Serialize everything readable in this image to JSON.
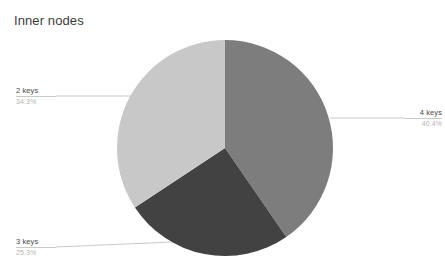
{
  "chart_data": {
    "type": "pie",
    "title": "Inner nodes",
    "categories": [
      "4 keys",
      "3 keys",
      "2 keys"
    ],
    "values": [
      40.4,
      25.3,
      34.3
    ],
    "value_labels": [
      "40.4%",
      "25.3%",
      "34.3%"
    ],
    "colors": [
      "#7d7d7d",
      "#424242",
      "#c8c8c8"
    ],
    "start_angle_deg": 0,
    "direction": "clockwise",
    "legend": "none",
    "grid": false,
    "labels_position": "outside-with-leader-lines",
    "background": "#ffffff",
    "slices": [
      {
        "name": "4 keys",
        "percent_label": "40.4%",
        "percent": 40.4,
        "color": "#7d7d7d",
        "label_side": "right"
      },
      {
        "name": "3 keys",
        "percent_label": "25.3%",
        "percent": 25.3,
        "color": "#424242",
        "label_side": "bottom-left"
      },
      {
        "name": "2 keys",
        "percent_label": "34.3%",
        "percent": 34.3,
        "color": "#c8c8c8",
        "label_side": "left"
      }
    ]
  }
}
